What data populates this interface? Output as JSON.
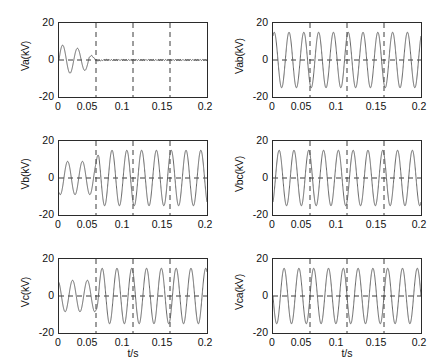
{
  "figure": {
    "background": "#ffffff",
    "trace_color": "#555555",
    "axis_color": "#2b2b2b",
    "grid_color": "#3a3a3a",
    "fault_time": 0.04,
    "switch_time": 0.05
  },
  "axes": {
    "xlabel": "t/s",
    "xticks": [
      "0",
      "0.05",
      "0.1",
      "0.15",
      "0.2"
    ],
    "xtick_values": [
      0,
      0.05,
      0.1,
      0.15,
      0.2
    ],
    "yticks": [
      "20",
      "0",
      "-20"
    ],
    "ytick_values": [
      20,
      0,
      -20
    ],
    "xlim": [
      0,
      0.2
    ],
    "ylim": [
      -20,
      20
    ],
    "gridlines_x": [
      0.05,
      0.1,
      0.15
    ],
    "gridlines_y": [
      0
    ]
  },
  "chart_data": [
    {
      "type": "line",
      "panel": "top-left",
      "title": "",
      "ylabel": "Va(kV)",
      "xlabel": "",
      "xlim": [
        0,
        0.2
      ],
      "ylim": [
        -20,
        20
      ],
      "grid": true,
      "frequency_hz": 50,
      "series": [
        {
          "name": "Va",
          "waveform": "damped-collapse",
          "amplitude_pre": 8.5,
          "amplitude_post": 0.25,
          "phase_deg": 0,
          "decay_start": 0.012,
          "collapse_time": 0.04,
          "description": "Phase A voltage collapses to near zero after ground fault at t=0.04 s"
        }
      ]
    },
    {
      "type": "line",
      "panel": "top-right",
      "title": "",
      "ylabel": "Vab(kV)",
      "xlabel": "",
      "xlim": [
        0,
        0.2
      ],
      "ylim": [
        -20,
        20
      ],
      "grid": true,
      "frequency_hz": 50,
      "series": [
        {
          "name": "Vab",
          "waveform": "sinusoid",
          "amplitude_pre": 15,
          "amplitude_post": 15,
          "phase_deg": 60,
          "description": "Line voltage A-B remains unchanged through the fault"
        }
      ]
    },
    {
      "type": "line",
      "panel": "middle-left",
      "title": "",
      "ylabel": "Vb(kV)",
      "xlabel": "",
      "xlim": [
        0,
        0.2
      ],
      "ylim": [
        -20,
        20
      ],
      "grid": true,
      "frequency_hz": 50,
      "series": [
        {
          "name": "Vb",
          "waveform": "step-rise",
          "amplitude_pre": 9,
          "amplitude_post": 15,
          "phase_deg": -120,
          "step_time": 0.05,
          "description": "Phase B voltage rises from 9 kV to 15 kV after the fault"
        }
      ]
    },
    {
      "type": "line",
      "panel": "middle-right",
      "title": "",
      "ylabel": "Vbc(kV)",
      "xlabel": "",
      "xlim": [
        0,
        0.2
      ],
      "ylim": [
        -20,
        20
      ],
      "grid": true,
      "frequency_hz": 50,
      "series": [
        {
          "name": "Vbc",
          "waveform": "sinusoid",
          "amplitude_pre": 15,
          "amplitude_post": 15,
          "phase_deg": -60,
          "description": "Line voltage B-C remains unchanged through the fault"
        }
      ]
    },
    {
      "type": "line",
      "panel": "bottom-left",
      "title": "",
      "ylabel": "Vc(kV)",
      "xlabel": "t/s",
      "xlim": [
        0,
        0.2
      ],
      "ylim": [
        -20,
        20
      ],
      "grid": true,
      "frequency_hz": 50,
      "series": [
        {
          "name": "Vc",
          "waveform": "step-rise",
          "amplitude_pre": 8.5,
          "amplitude_post": 15,
          "phase_deg": 120,
          "step_time": 0.05,
          "description": "Phase C voltage rises from 8.5 kV to 15 kV after the fault"
        }
      ]
    },
    {
      "type": "line",
      "panel": "bottom-right",
      "title": "",
      "ylabel": "Vca(kV)",
      "xlabel": "t/s",
      "xlim": [
        0,
        0.2
      ],
      "ylim": [
        -20,
        20
      ],
      "grid": true,
      "frequency_hz": 50,
      "series": [
        {
          "name": "Vca",
          "waveform": "sinusoid",
          "amplitude_pre": 15,
          "amplitude_post": 15,
          "phase_deg": 180,
          "description": "Line voltage C-A remains unchanged through the fault"
        }
      ]
    }
  ]
}
